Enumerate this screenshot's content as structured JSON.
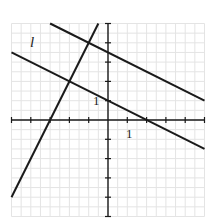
{
  "diagram": {
    "type": "coordinate-plane",
    "x_range": [
      -5,
      5
    ],
    "y_range": [
      -5,
      5
    ],
    "grid_step": 0.5,
    "tick_step": 1,
    "colors": {
      "grid": "#e4e4e4",
      "axis": "#1a1a1a",
      "line": "#1a1a1a"
    },
    "labels": {
      "line_label": "l",
      "x_unit": "1",
      "y_unit": "1"
    },
    "lines": [
      {
        "name": "steep-line",
        "slope": 2,
        "intercept": 6
      },
      {
        "name": "upper-parallel-line",
        "slope": -0.5,
        "intercept": 3.5
      },
      {
        "name": "line-l",
        "slope": -0.5,
        "intercept": 1
      }
    ]
  }
}
